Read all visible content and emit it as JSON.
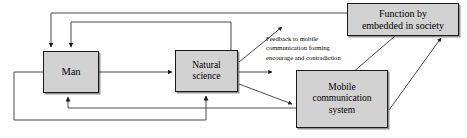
{
  "diagram": {
    "background_color": "#ffffff",
    "node_fill_color": "#d2d2d2",
    "node_border_color": "#1a1a1a",
    "connector_color": "#3d3d3d",
    "text_color": "#000000",
    "nodes": [
      {
        "id": "man",
        "label": "Man"
      },
      {
        "id": "natural_science",
        "label": "Natural\nscience"
      },
      {
        "id": "function_society",
        "label": "Function by\nembedded in society"
      },
      {
        "id": "mobile_comm",
        "label": "Mobile\ncommunication\nsystem"
      }
    ],
    "annotations": [
      {
        "id": "feedback_note",
        "text": "Feedback to mobile\ncommunication forming\nencourage and contradiction"
      }
    ],
    "edges": [
      {
        "id": "man-to-natural-science",
        "from": "man",
        "to": "natural_science",
        "style": "straight-horizontal"
      },
      {
        "id": "function-society-to-man",
        "from": "function_society",
        "to": "man",
        "style": "orthogonal-top-outer"
      },
      {
        "id": "natural-science-to-man-top",
        "from": "natural_science",
        "to": "man",
        "style": "orthogonal-top-inner"
      },
      {
        "id": "man-to-natural-science-bottom",
        "from": "man",
        "to": "natural_science",
        "style": "orthogonal-bottom-outer"
      },
      {
        "id": "mobile-comm-to-man-bottom",
        "from": "mobile_comm",
        "to": "man",
        "style": "orthogonal-bottom-inner"
      },
      {
        "id": "natural-science-to-feedback",
        "from": "natural_science",
        "to": "feedback_note",
        "style": "diagonal-up"
      },
      {
        "id": "natural-science-stub",
        "from": "natural_science",
        "to": "feedback_note",
        "style": "short-horizontal-stub"
      },
      {
        "id": "natural-science-to-mobile-comm",
        "from": "natural_science",
        "to": "mobile_comm",
        "style": "diagonal-down"
      },
      {
        "id": "function-society-to-mobile-comm",
        "from": "function_society",
        "to": "mobile_comm",
        "style": "diagonal-down-left"
      },
      {
        "id": "mobile-comm-to-function-society",
        "from": "mobile_comm",
        "to": "function_society",
        "style": "diagonal-up-right"
      }
    ]
  }
}
